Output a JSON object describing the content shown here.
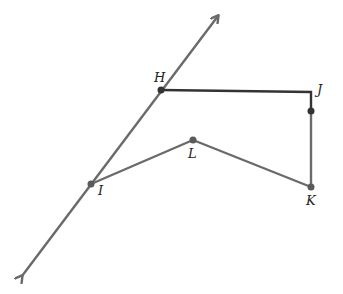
{
  "colors": {
    "line": "#6a6a6a",
    "dark_segment": "#333333",
    "point": "#5a5a5a",
    "label": "#222222",
    "background": "#ffffff"
  },
  "line": {
    "name": "line through H and I",
    "start": [
      22,
      276
    ],
    "end": [
      218,
      16
    ],
    "arrows": "both"
  },
  "points": [
    {
      "id": "H",
      "label": "H",
      "x": 161,
      "y": 90,
      "lx": 154,
      "ly": 82
    },
    {
      "id": "J",
      "label": "J",
      "x": 311,
      "y": 111,
      "lx": 317,
      "ly": 94
    },
    {
      "id": "K",
      "label": "K",
      "x": 311,
      "y": 187,
      "lx": 306,
      "ly": 205
    },
    {
      "id": "L",
      "label": "L",
      "x": 193,
      "y": 140,
      "lx": 188,
      "ly": 158
    },
    {
      "id": "I",
      "label": "I",
      "x": 91,
      "y": 184,
      "lx": 98,
      "ly": 195
    }
  ],
  "segments": [
    {
      "from": "H",
      "to": "J-corner",
      "style": "dark"
    },
    {
      "from": "J-corner",
      "to": "J",
      "style": "dark"
    },
    {
      "from": "J",
      "to": "K",
      "style": "normal"
    },
    {
      "from": "K",
      "to": "L",
      "style": "normal"
    },
    {
      "from": "L",
      "to": "I",
      "style": "normal"
    }
  ],
  "labels": {
    "H": "H",
    "J": "J",
    "K": "K",
    "L": "L",
    "I": "I"
  }
}
